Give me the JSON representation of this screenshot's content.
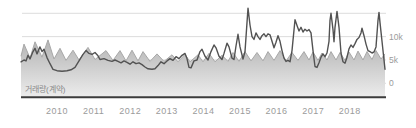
{
  "chart_data": {
    "type": "area",
    "title": "",
    "pane_label": "거래량(계약)",
    "x_axis": {
      "labels": [
        "2010",
        "2011",
        "2012",
        "2013",
        "2014",
        "2015",
        "2016",
        "2017",
        "2018"
      ]
    },
    "y_axis": {
      "unit": "contracts (k)",
      "range_k": [
        0,
        16.5
      ],
      "ticks": [
        {
          "value_k": 15,
          "label": ""
        },
        {
          "value_k": 10,
          "label": "10k"
        },
        {
          "value_k": 5,
          "label": "5k"
        },
        {
          "value_k": 0,
          "label": "0"
        }
      ]
    },
    "series": [
      {
        "name": "volume-area",
        "type": "area",
        "edge_color": "#a8a8a8",
        "fill_top_color": "#969696",
        "fill_bottom_color": "#ececec",
        "points_x_valk": [
          [
            21,
            5.8
          ],
          [
            24,
            8.4
          ],
          [
            30,
            5.4
          ],
          [
            35,
            8.9
          ],
          [
            42,
            5.6
          ],
          [
            48,
            9.3
          ],
          [
            54,
            5.2
          ],
          [
            60,
            7.5
          ],
          [
            66,
            4.9
          ],
          [
            73,
            7.1
          ],
          [
            79,
            5.0
          ],
          [
            88,
            7.7
          ],
          [
            95,
            5.1
          ],
          [
            106,
            7.0
          ],
          [
            113,
            4.9
          ],
          [
            120,
            7.0
          ],
          [
            126,
            4.8
          ],
          [
            132,
            7.1
          ],
          [
            138,
            4.8
          ],
          [
            143,
            6.8
          ],
          [
            150,
            4.7
          ],
          [
            157,
            6.3
          ],
          [
            164,
            4.7
          ],
          [
            172,
            6.1
          ],
          [
            178,
            4.6
          ],
          [
            185,
            6.2
          ],
          [
            190,
            4.6
          ],
          [
            198,
            6.1
          ],
          [
            203,
            4.6
          ],
          [
            209,
            6.4
          ],
          [
            215,
            4.6
          ],
          [
            222,
            6.0
          ],
          [
            228,
            4.7
          ],
          [
            233,
            6.6
          ],
          [
            239,
            4.7
          ],
          [
            245,
            6.8
          ],
          [
            251,
            4.8
          ],
          [
            257,
            6.6
          ],
          [
            263,
            4.8
          ],
          [
            268,
            6.8
          ],
          [
            274,
            4.9
          ],
          [
            280,
            7.0
          ],
          [
            286,
            4.8
          ],
          [
            292,
            6.6
          ],
          [
            298,
            4.9
          ],
          [
            304,
            6.8
          ],
          [
            309,
            5.0
          ],
          [
            313,
            6.7
          ],
          [
            318,
            4.9
          ],
          [
            322,
            6.5
          ],
          [
            327,
            5.0
          ],
          [
            331,
            6.8
          ],
          [
            336,
            5.0
          ],
          [
            340,
            6.6
          ],
          [
            345,
            4.9
          ],
          [
            349,
            6.7
          ],
          [
            354,
            5.0
          ],
          [
            358,
            6.9
          ],
          [
            363,
            5.0
          ],
          [
            367,
            6.8
          ],
          [
            372,
            5.1
          ],
          [
            376,
            7.0
          ],
          [
            381,
            5.2
          ],
          [
            385,
            6.3
          ]
        ]
      },
      {
        "name": "volume-line",
        "type": "line",
        "color": "#525252",
        "points_x_valk": [
          [
            21,
            4.6
          ],
          [
            24,
            5.0
          ],
          [
            26,
            4.8
          ],
          [
            28,
            6.0
          ],
          [
            30,
            5.2
          ],
          [
            33,
            6.8
          ],
          [
            35,
            7.5
          ],
          [
            37,
            6.3
          ],
          [
            40,
            7.8
          ],
          [
            42,
            6.8
          ],
          [
            44,
            7.3
          ],
          [
            47,
            5.5
          ],
          [
            50,
            4.2
          ],
          [
            53,
            3.0
          ],
          [
            57,
            2.7
          ],
          [
            62,
            2.6
          ],
          [
            67,
            2.7
          ],
          [
            71,
            2.9
          ],
          [
            75,
            3.4
          ],
          [
            79,
            4.8
          ],
          [
            83,
            6.2
          ],
          [
            86,
            7.0
          ],
          [
            89,
            6.4
          ],
          [
            92,
            6.2
          ],
          [
            95,
            6.6
          ],
          [
            98,
            5.9
          ],
          [
            100,
            5.1
          ],
          [
            104,
            5.3
          ],
          [
            108,
            4.9
          ],
          [
            112,
            4.7
          ],
          [
            115,
            5.0
          ],
          [
            118,
            4.7
          ],
          [
            121,
            4.4
          ],
          [
            124,
            4.8
          ],
          [
            127,
            4.5
          ],
          [
            130,
            4.1
          ],
          [
            133,
            4.6
          ],
          [
            136,
            4.2
          ],
          [
            139,
            4.4
          ],
          [
            142,
            4.0
          ],
          [
            145,
            3.5
          ],
          [
            148,
            3.1
          ],
          [
            152,
            3.0
          ],
          [
            155,
            3.1
          ],
          [
            158,
            3.8
          ],
          [
            161,
            4.6
          ],
          [
            164,
            4.2
          ],
          [
            167,
            4.8
          ],
          [
            170,
            5.3
          ],
          [
            173,
            4.9
          ],
          [
            176,
            5.7
          ],
          [
            179,
            5.3
          ],
          [
            182,
            6.0
          ],
          [
            185,
            6.4
          ],
          [
            187,
            5.3
          ],
          [
            189,
            3.4
          ],
          [
            191,
            3.3
          ],
          [
            194,
            4.8
          ],
          [
            197,
            5.0
          ],
          [
            200,
            6.8
          ],
          [
            202,
            7.3
          ],
          [
            205,
            5.8
          ],
          [
            208,
            5.0
          ],
          [
            211,
            6.8
          ],
          [
            214,
            8.2
          ],
          [
            216,
            7.6
          ],
          [
            219,
            5.8
          ],
          [
            222,
            5.1
          ],
          [
            224,
            6.4
          ],
          [
            227,
            8.6
          ],
          [
            229,
            7.8
          ],
          [
            232,
            5.4
          ],
          [
            234,
            5.1
          ],
          [
            236,
            8.0
          ],
          [
            238,
            10.5
          ],
          [
            240,
            7.8
          ],
          [
            243,
            5.2
          ],
          [
            245,
            6.8
          ],
          [
            247,
            13.0
          ],
          [
            248,
            16.1
          ],
          [
            250,
            12.5
          ],
          [
            252,
            10.0
          ],
          [
            254,
            9.4
          ],
          [
            256,
            10.8
          ],
          [
            258,
            10.0
          ],
          [
            260,
            9.4
          ],
          [
            262,
            10.2
          ],
          [
            264,
            10.6
          ],
          [
            266,
            10.0
          ],
          [
            268,
            10.6
          ],
          [
            270,
            10.4
          ],
          [
            272,
            9.0
          ],
          [
            274,
            7.6
          ],
          [
            276,
            8.8
          ],
          [
            278,
            10.2
          ],
          [
            280,
            9.0
          ],
          [
            282,
            7.0
          ],
          [
            284,
            5.4
          ],
          [
            286,
            4.7
          ],
          [
            288,
            4.9
          ],
          [
            290,
            4.6
          ],
          [
            292,
            7.0
          ],
          [
            295,
            13.6
          ],
          [
            297,
            12.4
          ],
          [
            299,
            11.2
          ],
          [
            301,
            12.0
          ],
          [
            303,
            11.0
          ],
          [
            305,
            11.6
          ],
          [
            307,
            11.2
          ],
          [
            309,
            11.5
          ],
          [
            311,
            10.8
          ],
          [
            313,
            7.0
          ],
          [
            315,
            3.6
          ],
          [
            317,
            3.4
          ],
          [
            319,
            4.4
          ],
          [
            321,
            5.6
          ],
          [
            323,
            6.3
          ],
          [
            325,
            5.7
          ],
          [
            327,
            6.5
          ],
          [
            329,
            9.0
          ],
          [
            330,
            13.5
          ],
          [
            331,
            15.0
          ],
          [
            333,
            11.5
          ],
          [
            334,
            8.9
          ],
          [
            335,
            12.0
          ],
          [
            337,
            15.4
          ],
          [
            339,
            12.0
          ],
          [
            341,
            6.5
          ],
          [
            343,
            4.6
          ],
          [
            345,
            4.3
          ],
          [
            347,
            5.6
          ],
          [
            349,
            7.4
          ],
          [
            351,
            8.2
          ],
          [
            353,
            7.7
          ],
          [
            355,
            8.5
          ],
          [
            357,
            9.4
          ],
          [
            359,
            9.8
          ],
          [
            361,
            10.8
          ],
          [
            362,
            11.8
          ],
          [
            364,
            10.2
          ],
          [
            366,
            8.4
          ],
          [
            368,
            7.0
          ],
          [
            370,
            6.8
          ],
          [
            372,
            6.5
          ],
          [
            374,
            6.7
          ],
          [
            376,
            7.8
          ],
          [
            378,
            13.5
          ],
          [
            379,
            15.2
          ],
          [
            380,
            13.0
          ],
          [
            382,
            9.0
          ],
          [
            384,
            5.0
          ],
          [
            385,
            3.0
          ]
        ]
      }
    ],
    "layout": {
      "width": 416,
      "height": 128,
      "plot_left": 21,
      "plot_right": 386,
      "grid_left": 22,
      "zero_y": 83.3,
      "px_per_1k": 4.667,
      "pane_bottom_y": 97,
      "axis_line_y": 97.2,
      "ylabel_left": 389,
      "xlabel_top": 107,
      "year_first_x": 57,
      "year_step_x": 36.6,
      "grid_color": "#dcdcdc",
      "axis_color": "#3c3c3c",
      "label_color": "#9b9b9b",
      "legend_position": "none",
      "grid": "horizontal-only"
    }
  }
}
